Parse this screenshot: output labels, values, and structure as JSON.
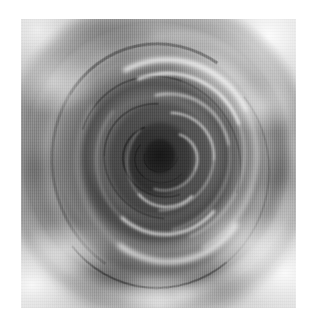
{
  "page": {
    "background_color": "#ffffff",
    "width": 317,
    "height": 325,
    "alt_text": ""
  },
  "figure": {
    "name": "grayscale-vortex-render",
    "caption": "",
    "palette": {
      "plate_background": "#8d8d8d",
      "highlight": "#ffffff",
      "midtone": "#9a9a9a",
      "shadow": "#3a3a3a",
      "core_shadow": "#2b2b2b",
      "page_white": "#ffffff"
    },
    "plate": {
      "left": 21,
      "top": 19,
      "width": 275,
      "height": 289
    },
    "rendering": "shaded 3d surface, grayscale, vertical scanline texture",
    "center": {
      "x": "49%",
      "y": "47%"
    },
    "rings": [
      {
        "label": "outer-rim",
        "size": "88%",
        "tone": "mid-light"
      },
      {
        "label": "rim-shadow",
        "size": "72%",
        "tone": "dark"
      },
      {
        "label": "mid-fold",
        "size": "56%",
        "tone": "mid"
      },
      {
        "label": "inner-fold",
        "size": "40%",
        "tone": "mid-dark"
      },
      {
        "label": "spiral-fold",
        "size": "26%",
        "tone": "dark"
      },
      {
        "label": "core",
        "size": "12%",
        "tone": "darkest"
      }
    ],
    "highlights": [
      {
        "label": "top-right-corner-glow"
      },
      {
        "label": "bottom-right-corner-glow"
      },
      {
        "label": "bottom-left-corner-glow"
      },
      {
        "label": "top-left-corner-glow"
      },
      {
        "label": "upper-ring-specular-arc"
      },
      {
        "label": "lower-ring-specular-arc"
      },
      {
        "label": "inner-spiral-specular"
      }
    ]
  }
}
